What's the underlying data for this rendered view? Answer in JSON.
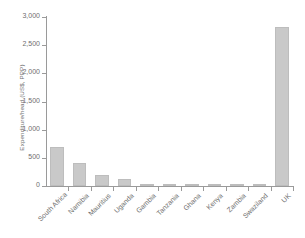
{
  "chart_data": {
    "type": "bar",
    "title": "",
    "subtitle": "",
    "xlabel": "",
    "ylabel": "Expenditure/head (US$, PPP)",
    "categories": [
      "South Africa",
      "Namibia",
      "Mauritius",
      "Uganda",
      "Gambia",
      "Tanzania",
      "Ghana",
      "Kenya",
      "Zambia",
      "Swaziland",
      "UK"
    ],
    "values": [
      700,
      410,
      190,
      120,
      20,
      12,
      10,
      9,
      8,
      7,
      2820
    ],
    "ylim": [
      0,
      3000
    ],
    "ytick_values": [
      0,
      500,
      1000,
      1500,
      2000,
      2500,
      3000
    ],
    "ytick_labels": [
      "0",
      "500",
      "1,000",
      "1,500",
      "2,000",
      "2,500",
      "3,000"
    ],
    "grid": false,
    "legend": null,
    "bar_color": "#c9c9c9",
    "axis_color": "#9a9a9a",
    "text_color": "#6e6e6e",
    "background_color": "#ffffff"
  }
}
